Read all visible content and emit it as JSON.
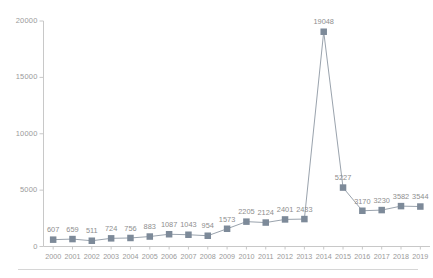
{
  "chart_data": {
    "type": "line",
    "title": "",
    "subtitle": "",
    "xlabel": "",
    "ylabel": "",
    "categories": [
      "2000",
      "2001",
      "2002",
      "2003",
      "2004",
      "2005",
      "2006",
      "2007",
      "2008",
      "2009",
      "2010",
      "2011",
      "2012",
      "2013",
      "2014",
      "2015",
      "2016",
      "2017",
      "2018",
      "2019"
    ],
    "values": [
      607,
      659,
      511,
      724,
      756,
      883,
      1087,
      1043,
      954,
      1573,
      2205,
      2124,
      2401,
      2433,
      19048,
      5227,
      3170,
      3230,
      3582,
      3544
    ],
    "series": [
      {
        "name": "",
        "values": [
          607,
          659,
          511,
          724,
          756,
          883,
          1087,
          1043,
          954,
          1573,
          2205,
          2124,
          2401,
          2433,
          19048,
          5227,
          3170,
          3230,
          3582,
          3544
        ]
      }
    ],
    "data_labels": [
      "607",
      "659",
      "511",
      "724",
      "756",
      "883",
      "1087",
      "1043",
      "954",
      "1573",
      "2205",
      "2124",
      "2401",
      "2433",
      "19048",
      "5227",
      "3170",
      "3230",
      "3582",
      "3544"
    ],
    "ylim": [
      0,
      20000
    ],
    "yticks": [
      0,
      5000,
      10000,
      15000,
      20000
    ],
    "ytick_labels": [
      "0",
      "5000",
      "10000",
      "15000",
      "20000"
    ],
    "grid": false,
    "legend": "none",
    "marker": "square",
    "marker_color": "#7d8a99",
    "line_color": "#9aa3ad",
    "axis_color": "#c8c8c8",
    "label_color": "#8e8e8e"
  }
}
